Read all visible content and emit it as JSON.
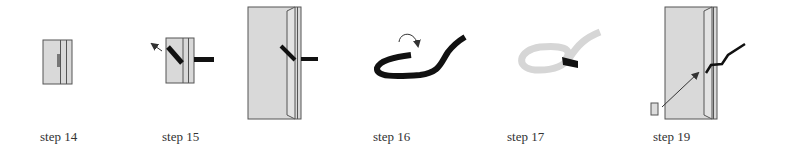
{
  "diagram": {
    "steps": [
      {
        "id": "step14",
        "label": "step 14",
        "label_x": 40
      },
      {
        "id": "step15",
        "label": "step 15",
        "label_x": 162
      },
      {
        "id": "step16",
        "label": "step 16",
        "label_x": 373
      },
      {
        "id": "step17",
        "label": "step 17",
        "label_x": 507
      },
      {
        "id": "step19",
        "label": "step 19",
        "label_x": 653
      }
    ],
    "colors": {
      "panel_fill": "#d9d9d9",
      "outline": "#555555",
      "strap": "#111111",
      "strap_light": "#d6d6d6",
      "arrow": "#333333"
    }
  }
}
